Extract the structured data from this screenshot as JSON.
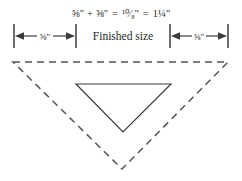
{
  "diagram": {
    "canvas": {
      "width": 242,
      "height": 181,
      "background": "#ffffff"
    },
    "equation": {
      "full": "⅝\" + ⅝\" = ¹⁰⁄₈\" = 1¼\"",
      "term_a": "⅝\"",
      "plus": "+",
      "term_b": "⅝\"",
      "equals_1": "=",
      "sum_improper": "¹⁰⁄₈\"",
      "equals_2": "=",
      "sum_mixed": "1¼\""
    },
    "dimension_row": {
      "left_segment_label": "⅝\"",
      "center_segment_label": "Finished size",
      "right_segment_label": "⅝\"",
      "tick_positions_px": [
        14,
        76,
        170,
        228
      ],
      "tick_top_px": 24,
      "tick_bottom_px": 48,
      "arrow_baseline_px": 36
    },
    "shapes": {
      "outer_triangle": {
        "name": "cut-size-triangle",
        "style": "dashed",
        "stroke": "#555555",
        "points": "13,62 228,62 122,169"
      },
      "inner_triangle": {
        "name": "finished-size-triangle",
        "style": "solid",
        "stroke": "#3a3a3a",
        "points": "76,84 171,84 123,132"
      }
    }
  }
}
